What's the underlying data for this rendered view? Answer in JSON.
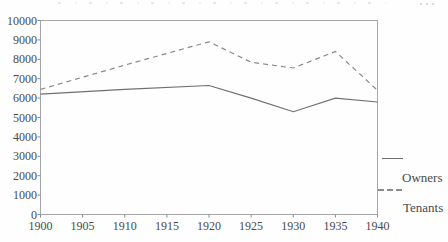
{
  "chart_data": {
    "type": "line",
    "x": [
      1900,
      1910,
      1920,
      1925,
      1930,
      1935,
      1940
    ],
    "series": [
      {
        "name": "Owners",
        "style": "solid",
        "values": [
          6200,
          6450,
          6650,
          6000,
          5300,
          6000,
          5800
        ]
      },
      {
        "name": "Tenants",
        "style": "dashed",
        "values": [
          6450,
          7700,
          8900,
          7850,
          7550,
          8400,
          6400
        ]
      }
    ],
    "title": "",
    "xlabel": "",
    "ylabel": "",
    "x_range": [
      1900,
      1940
    ],
    "ylim": [
      0,
      10000
    ],
    "x_tick_labels": [
      "1900",
      "1905",
      "1910",
      "1915",
      "1920",
      "1925",
      "1930",
      "1935",
      "1940"
    ],
    "y_tick_labels": [
      "10000",
      "9000",
      "8000",
      "7000",
      "6000",
      "5000",
      "4000",
      "3000",
      "2000",
      "1000",
      "0"
    ],
    "grid": false,
    "legend_position": "right-outside",
    "colors": {
      "line": "#6f6f6f",
      "frame": "#a6a6a6",
      "tick": "#8a8a8a",
      "text": "#4a4a4a"
    }
  },
  "legend": {
    "items": [
      {
        "label": "Owners",
        "style": "solid"
      },
      {
        "label": "Tenants",
        "style": "dashed"
      }
    ]
  }
}
